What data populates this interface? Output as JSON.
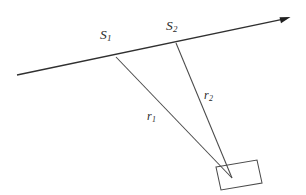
{
  "figure": {
    "background_color": "#ffffff",
    "line_color": "#3a3a3a",
    "text_color": "#2a2a2a",
    "width": 306,
    "height": 195
  },
  "labels": {
    "s1": {
      "base": "S",
      "sub": "1",
      "text": "S1"
    },
    "s2": {
      "base": "S",
      "sub": "2",
      "text": "S2"
    },
    "r1": {
      "base": "r",
      "sub": "1",
      "text": "r1"
    },
    "r2": {
      "base": "r",
      "sub": "2",
      "text": "r2"
    }
  },
  "geometry": {
    "baseline": {
      "x1": 17,
      "y1": 75,
      "x2": 289,
      "y2": 18,
      "arrow_at": "right-end"
    },
    "source_point_1": {
      "x": 116,
      "y": 57
    },
    "source_point_2": {
      "x": 176,
      "y": 43
    },
    "target_point": {
      "x": 232,
      "y": 178
    },
    "ray_1": {
      "from": "source_point_1",
      "to": "target_point"
    },
    "ray_2": {
      "from": "source_point_2",
      "to": "target_point"
    },
    "object_rect_corners": [
      {
        "x": 216,
        "y": 167
      },
      {
        "x": 257,
        "y": 160
      },
      {
        "x": 262,
        "y": 183
      },
      {
        "x": 221,
        "y": 190
      }
    ]
  }
}
